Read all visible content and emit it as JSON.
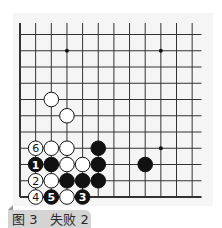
{
  "figure": {
    "caption": "图 3　失败 2",
    "caption_bg": "#d4d4d4"
  },
  "board": {
    "grid": {
      "cols": 12,
      "rows": 11,
      "origin_x": 20,
      "origin_y": 34.5,
      "spacing_x": 15.65,
      "spacing_y": 16.25,
      "line_color": "#333333",
      "edges": [
        "left",
        "bottom"
      ],
      "vertical_top_extend": 23,
      "horizontal_right_extend": 201.5
    },
    "star_points": [
      {
        "col": 3,
        "row": 1
      },
      {
        "col": 9,
        "row": 1
      },
      {
        "col": 9,
        "row": 7
      }
    ],
    "stones": [
      {
        "color": "white",
        "col": 2,
        "row": 4,
        "label": ""
      },
      {
        "color": "white",
        "col": 3,
        "row": 5,
        "label": ""
      },
      {
        "color": "white",
        "col": 1,
        "row": 7,
        "label": "6"
      },
      {
        "color": "white",
        "col": 2,
        "row": 7,
        "label": ""
      },
      {
        "color": "white",
        "col": 3,
        "row": 7,
        "label": ""
      },
      {
        "color": "black",
        "col": 5,
        "row": 7,
        "label": ""
      },
      {
        "color": "black",
        "col": 1,
        "row": 8,
        "label": "1"
      },
      {
        "color": "black",
        "col": 2,
        "row": 8,
        "label": ""
      },
      {
        "color": "white",
        "col": 3,
        "row": 8,
        "label": ""
      },
      {
        "color": "white",
        "col": 4,
        "row": 8,
        "label": ""
      },
      {
        "color": "black",
        "col": 5,
        "row": 8,
        "label": ""
      },
      {
        "color": "black",
        "col": 8,
        "row": 8,
        "label": ""
      },
      {
        "color": "white",
        "col": 1,
        "row": 9,
        "label": "2"
      },
      {
        "color": "white",
        "col": 2,
        "row": 9,
        "label": ""
      },
      {
        "color": "black",
        "col": 3,
        "row": 9,
        "label": ""
      },
      {
        "color": "black",
        "col": 4,
        "row": 9,
        "label": ""
      },
      {
        "color": "black",
        "col": 5,
        "row": 9,
        "label": ""
      },
      {
        "color": "white",
        "col": 1,
        "row": 10,
        "label": "4"
      },
      {
        "color": "black",
        "col": 2,
        "row": 10,
        "label": "5"
      },
      {
        "color": "white",
        "col": 3,
        "row": 10,
        "label": ""
      },
      {
        "color": "black",
        "col": 4,
        "row": 10,
        "label": "3"
      }
    ]
  }
}
